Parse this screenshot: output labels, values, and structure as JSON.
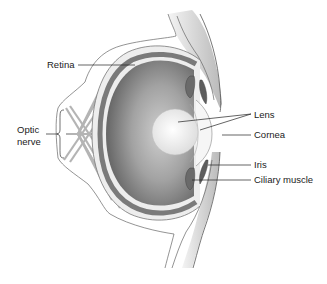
{
  "diagram": {
    "title": "",
    "type": "anatomical cross-section of the human eye",
    "labels": {
      "retina": "Retina",
      "optic_nerve_line1": "Optic",
      "optic_nerve_line2": "nerve",
      "lens": "Lens",
      "cornea": "Cornea",
      "iris": "Iris",
      "ciliary_muscle": "Ciliary muscle"
    },
    "colors": {
      "background": "#ffffff",
      "outline": "#555555",
      "vitreous_dark": "#6e6e6e",
      "vitreous_light": "#bdbdbd",
      "retina_band": "#7a7a7a",
      "lens": "#f2f2f2",
      "leader_line": "#222222"
    }
  }
}
